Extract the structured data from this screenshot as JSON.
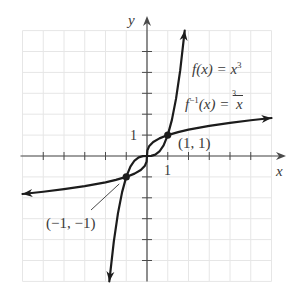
{
  "chart_data": {
    "type": "line",
    "title": "",
    "xlabel": "x",
    "ylabel": "y",
    "xlim": [
      -6,
      6
    ],
    "ylim": [
      -6,
      6
    ],
    "grid": true,
    "tick_step": 1,
    "tick_labels": {
      "x": [
        "1"
      ],
      "y": [
        "1"
      ]
    },
    "series": [
      {
        "name": "f(x) = x^3",
        "label_parts": {
          "prefix": "f",
          "arg": "(x) = x",
          "exp": "3"
        },
        "x": [
          -1.817,
          -1.6,
          -1.4,
          -1.2,
          -1.0,
          -0.8,
          -0.6,
          -0.4,
          -0.2,
          0,
          0.2,
          0.4,
          0.6,
          0.8,
          1.0,
          1.2,
          1.4,
          1.6,
          1.817
        ],
        "y": [
          -6.0,
          -4.096,
          -2.744,
          -1.728,
          -1.0,
          -0.512,
          -0.216,
          -0.064,
          -0.008,
          0,
          0.008,
          0.064,
          0.216,
          0.512,
          1.0,
          1.728,
          2.744,
          4.096,
          6.0
        ],
        "arrows": "both"
      },
      {
        "name": "f^-1(x) = cbrt(x)",
        "label_parts": {
          "prefix": "f",
          "exp": "−1",
          "arg": "(x) = ",
          "root_index": "3",
          "radicand": "x"
        },
        "x": [
          -6,
          -5,
          -4,
          -3,
          -2,
          -1.5,
          -1,
          -0.6,
          -0.3,
          -0.1,
          -0.02,
          0,
          0.02,
          0.1,
          0.3,
          0.6,
          1,
          1.5,
          2,
          3,
          4,
          5,
          6
        ],
        "y": [
          -1.817,
          -1.71,
          -1.587,
          -1.442,
          -1.26,
          -1.145,
          -1.0,
          -0.843,
          -0.669,
          -0.464,
          -0.271,
          0,
          0.271,
          0.464,
          0.669,
          0.843,
          1.0,
          1.145,
          1.26,
          1.442,
          1.587,
          1.71,
          1.817
        ],
        "arrows": "both"
      }
    ],
    "annotations": [
      {
        "text": "(1, 1)",
        "x": 1,
        "y": 1,
        "marker": true
      },
      {
        "text": "(−1, −1)",
        "x": -1,
        "y": -1,
        "marker": true,
        "pointer_line": true
      }
    ],
    "style": {
      "curve_color": "#1c1c1c",
      "axis_color": "#4a4a4a",
      "grid_color": "#e6e6e6",
      "text_color": "#3a3a3a"
    }
  },
  "labels": {
    "x_axis": "x",
    "y_axis": "y",
    "x_tick_one": "1",
    "y_tick_one": "1",
    "point_pos": "(1, 1)",
    "point_neg": "(−1, −1)",
    "f_prefix": "f",
    "f_arg": "(x) = x",
    "f_exp": "3",
    "finv_prefix": "f",
    "finv_exp": "−1",
    "finv_arg": "(x) = ",
    "finv_root_index": "3",
    "finv_radicand": "x"
  }
}
